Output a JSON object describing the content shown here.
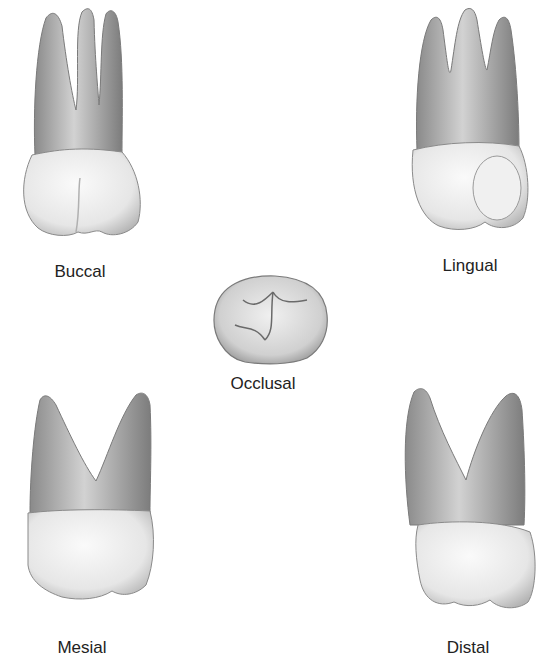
{
  "figure": {
    "views": [
      {
        "id": "buccal",
        "label": "Buccal"
      },
      {
        "id": "lingual",
        "label": "Lingual"
      },
      {
        "id": "occlusal",
        "label": "Occlusal"
      },
      {
        "id": "mesial",
        "label": "Mesial"
      },
      {
        "id": "distal",
        "label": "Distal"
      }
    ]
  },
  "colors": {
    "background": "#ffffff",
    "root": "#9a9a9a",
    "root_light": "#c8c8c8",
    "crown": "#ececec",
    "outline": "#6e6e6e",
    "label": "#222222"
  }
}
